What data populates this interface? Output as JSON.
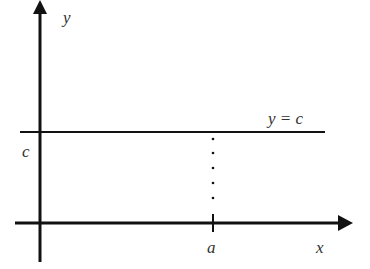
{
  "diagram": {
    "type": "constant-function-graph",
    "labels": {
      "y_axis": "y",
      "x_axis": "x",
      "line": "y = c",
      "y_intercept": "c",
      "x_point": "a"
    },
    "colors": {
      "stroke": "#111111",
      "text": "#333333",
      "background": "#ffffff"
    }
  }
}
